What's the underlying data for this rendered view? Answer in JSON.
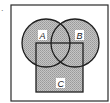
{
  "figure": {
    "question_mark": ".",
    "universe": {
      "x": 11,
      "y": 5,
      "width": 97,
      "height": 96,
      "stroke": "#2a2a2a"
    },
    "shading": {
      "fill": "#b8b8b8",
      "pattern": "stipple"
    },
    "sets": [
      {
        "name": "A",
        "shape": "circle",
        "cx": 46,
        "cy": 43,
        "r": 24,
        "label_x": 41,
        "label_y": 38
      },
      {
        "name": "B",
        "shape": "circle",
        "cx": 75,
        "cy": 43,
        "r": 24,
        "label_x": 78,
        "label_y": 38
      },
      {
        "name": "C",
        "shape": "square",
        "x": 36,
        "y": 43,
        "width": 47,
        "height": 49,
        "label_x": 59,
        "label_y": 86
      }
    ],
    "labels": {
      "A": "A",
      "B": "B",
      "C": "C"
    }
  }
}
